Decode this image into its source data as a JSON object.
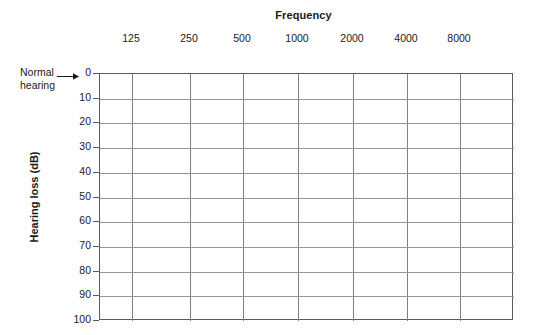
{
  "chart_data": {
    "type": "line",
    "title": "Frequency",
    "xlabel": "Frequency",
    "ylabel": "Hearing loss (dB)",
    "x_tick_labels": [
      "125",
      "250",
      "500",
      "1000",
      "2000",
      "4000",
      "8000"
    ],
    "y_tick_labels": [
      "0",
      "10",
      "20",
      "30",
      "40",
      "50",
      "60",
      "70",
      "80",
      "90",
      "100"
    ],
    "y_values": [
      0,
      10,
      20,
      30,
      40,
      50,
      60,
      70,
      80,
      90,
      100
    ],
    "ylim": [
      0,
      100
    ],
    "y_inverted": true,
    "grid": true,
    "legend": "none",
    "series": [],
    "annotations": [
      {
        "name": "normal-hearing",
        "line1": "Normal",
        "line2": "hearing",
        "arrow": "right-arrow",
        "points_to": "0"
      }
    ],
    "colors": {
      "grid": "#808080",
      "frame": "#5b5b5b",
      "text": "#1a1a1a",
      "background": "#ffffff"
    }
  }
}
